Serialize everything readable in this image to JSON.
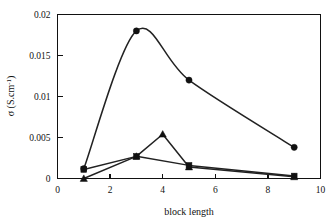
{
  "chart_data": {
    "type": "line",
    "title": "",
    "xlabel": "block length",
    "ylabel": "σ (S.cm⁻¹)",
    "ylabel_parts": {
      "symbol": "σ",
      "unit_open": " (S.cm",
      "unit_exp": "-1",
      "unit_close": ")"
    },
    "xlim": [
      0,
      10
    ],
    "ylim": [
      0,
      0.02
    ],
    "xticks": [
      0,
      2,
      4,
      6,
      8,
      10
    ],
    "xtick_labels": [
      "0",
      "2",
      "4",
      "6",
      "8",
      "10"
    ],
    "yticks": [
      0,
      0.005,
      0.01,
      0.015,
      0.02
    ],
    "ytick_labels": [
      "0",
      "0.005",
      "0.01",
      "0.015",
      "0.02"
    ],
    "grid": false,
    "legend": "none",
    "frame": "box",
    "series": [
      {
        "name": "series-high",
        "marker": "circle",
        "color": "#111111",
        "x": [
          1,
          3,
          5,
          9
        ],
        "values": [
          0.0012,
          0.018,
          0.012,
          0.0038
        ]
      },
      {
        "name": "series-mid",
        "marker": "triangle",
        "color": "#111111",
        "x": [
          1,
          3,
          4,
          5,
          9
        ],
        "values": [
          0.0,
          0.0027,
          0.0054,
          0.0014,
          0.0002
        ]
      },
      {
        "name": "series-low",
        "marker": "square",
        "color": "#111111",
        "x": [
          1,
          3,
          5,
          9
        ],
        "values": [
          0.0011,
          0.0027,
          0.0016,
          0.0003
        ]
      }
    ]
  },
  "figure": {
    "background_color": "#ffffff",
    "axis_color": "#111111"
  }
}
